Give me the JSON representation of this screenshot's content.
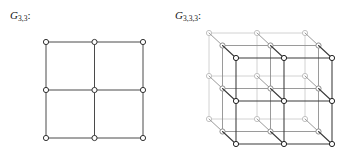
{
  "figure": {
    "background_color": "#ffffff",
    "panels": [
      {
        "id": "panel-2d",
        "label_prefix": "G",
        "label_subscript": "3,3",
        "label_suffix": ":",
        "label_full": "G3,3:"
      },
      {
        "id": "panel-3d",
        "label_prefix": "G",
        "label_subscript": "3,3,3",
        "label_suffix": ":",
        "label_full": "G3,3,3:"
      }
    ]
  },
  "colors": {
    "edge_front": "#3a3a3a",
    "edge_middle": "#8e8e8e",
    "edge_back": "#c6c6c6",
    "edge_flat": "#4a4a4a",
    "vertex_fill": "#ffffff",
    "vertex_stroke_front": "#222222",
    "vertex_stroke_middle": "#8e8e8e",
    "vertex_stroke_back": "#c2c2c2",
    "vertex_stroke_flat": "#333333",
    "text": "#141414"
  },
  "chart_data": {
    "type": "diagram",
    "subtitle": "",
    "xlabel": "",
    "ylabel": "",
    "graphs": [
      {
        "name": "G3,3",
        "description": "Two-dimensional 3 by 3 grid graph drawn as a square lattice",
        "dimensions": [
          3,
          3
        ],
        "vertex_count": 9,
        "edge_count": 12,
        "render": "flat",
        "origin": [
          46,
          42
        ],
        "step_x": 48.5,
        "step_y": 48,
        "vertex_radius": 2.6
      },
      {
        "name": "G3,3,3",
        "description": "Three-dimensional 3 by 3 by 3 grid graph drawn in oblique projection",
        "dimensions": [
          3,
          3,
          3
        ],
        "vertex_count": 27,
        "edge_count": 54,
        "render": "oblique",
        "origin_back_top_left": [
          209,
          33
        ],
        "step_x": 48,
        "step_y": 43,
        "depth_offset": [
          13.5,
          12.5
        ],
        "vertex_radius": 2.6,
        "layers": [
          {
            "index": 0,
            "name": "back",
            "color_key": "edge_back"
          },
          {
            "index": 1,
            "name": "middle",
            "color_key": "edge_middle"
          },
          {
            "index": 2,
            "name": "front",
            "color_key": "edge_front"
          }
        ]
      }
    ]
  }
}
